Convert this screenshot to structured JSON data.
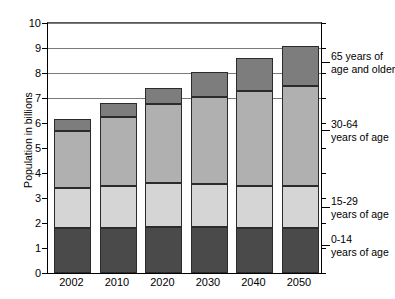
{
  "chart_data": {
    "type": "bar",
    "title": "",
    "subtitle": "",
    "xlabel": "",
    "ylabel": "Population in billions",
    "categories": [
      "2002",
      "2010",
      "2020",
      "2030",
      "2040",
      "2050"
    ],
    "ylim": [
      0,
      10
    ],
    "yticks": [
      0,
      1,
      2,
      3,
      4,
      5,
      6,
      7,
      8,
      9,
      10
    ],
    "ytick_labels": [
      "0",
      "1",
      "2",
      "3",
      "4",
      "5",
      "6",
      "7",
      "8",
      "9",
      "10"
    ],
    "gridlines": [
      7,
      8,
      9,
      10
    ],
    "grid": true,
    "stacked": true,
    "legend_position": "right",
    "series": [
      {
        "name": "0-14 years of age",
        "legend_label_line1": "0-14",
        "legend_label_line2": "years of age",
        "color": "#4a4a4a",
        "values": [
          1.8,
          1.8,
          1.85,
          1.85,
          1.8,
          1.8
        ]
      },
      {
        "name": "15-29 years of age",
        "legend_label_line1": "15-29",
        "legend_label_line2": "years of age",
        "color": "#d5d5d5",
        "values": [
          1.6,
          1.7,
          1.75,
          1.7,
          1.7,
          1.7
        ]
      },
      {
        "name": "30-64 years of age",
        "legend_label_line1": "30-64",
        "legend_label_line2": "years of age",
        "color": "#b0b0b0",
        "values": [
          2.3,
          2.75,
          3.15,
          3.5,
          3.8,
          4.0
        ]
      },
      {
        "name": "65 years of age and older",
        "legend_label_line1": "65 years of",
        "legend_label_line2": "age and older",
        "color": "#7d7d7d",
        "values": [
          0.45,
          0.55,
          0.65,
          1.0,
          1.3,
          1.6
        ]
      }
    ],
    "totals": [
      6.15,
      6.8,
      7.4,
      8.05,
      8.6,
      9.1
    ],
    "segment_tops": {
      "2002": [
        1.8,
        3.4,
        5.7,
        6.15
      ],
      "2010": [
        1.8,
        3.5,
        6.25,
        6.8
      ],
      "2020": [
        1.85,
        3.6,
        6.75,
        7.4
      ],
      "2030": [
        1.85,
        3.55,
        7.05,
        8.05
      ],
      "2040": [
        1.8,
        3.5,
        7.3,
        8.6
      ],
      "2050": [
        1.8,
        3.5,
        7.5,
        9.1
      ]
    }
  }
}
